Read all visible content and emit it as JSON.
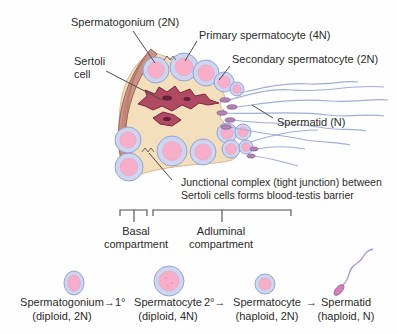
{
  "diagram_labels": {
    "spermatogonium": "Spermatogonium (2N)",
    "primary_spermatocyte": "Primary spermatocyte (4N)",
    "secondary_spermatocyte": "Secondary spermatocyte (2N)",
    "sertoli_line1": "Sertoli",
    "sertoli_line2": "cell",
    "spermatid": "Spermatid (N)",
    "junction_line1": "Junctional complex (tight junction) between",
    "junction_line2": "Sertoli cells forms blood-testis barrier"
  },
  "compartments": {
    "basal_line1": "Basal",
    "basal_line2": "compartment",
    "adluminal_line1": "Adluminal",
    "adluminal_line2": "compartment"
  },
  "sequence": {
    "stages": [
      {
        "name": "Spermatogonium",
        "ploidy": "(diploid, 2N)"
      },
      {
        "name": "Spermatocyte",
        "ploidy": "(diploid, 4N)"
      },
      {
        "name": "Spermatocyte",
        "ploidy": "(haploid, 2N)"
      },
      {
        "name": "Spermatid",
        "ploidy": "(haploid, N)"
      }
    ],
    "arrows": [
      "→1°",
      "2°→",
      "→"
    ]
  },
  "colors": {
    "epithelium": "#f4dfbd",
    "basement_membrane": "#cc9488",
    "membrane_outline": "#9c6353",
    "cell_ring": "#cdd5ef",
    "cell_ring_outline": "#8f9cce",
    "cell_nucleus": "#f6aec9",
    "sertoli_cell": "#b04a63",
    "sertoli_outline": "#7c2440",
    "sperm_tail": "#a0aeda",
    "line_and_text": "#3d3d3d"
  }
}
